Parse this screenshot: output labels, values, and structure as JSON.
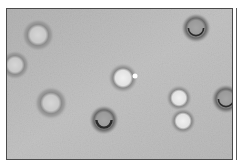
{
  "image": {
    "kind": "grayscale micrograph",
    "background_color": "#bdbdbd",
    "frame_color": "#4a4a4a",
    "cells": [
      {
        "id": 1,
        "cx": 31,
        "cy": 26,
        "r": 9,
        "style": "halo"
      },
      {
        "id": 2,
        "cx": 8,
        "cy": 56,
        "r": 8,
        "style": "halo-edge"
      },
      {
        "id": 3,
        "cx": 189,
        "cy": 19,
        "r": 8,
        "style": "dark-bottom"
      },
      {
        "id": 4,
        "cx": 116,
        "cy": 69,
        "r": 8,
        "style": "bright"
      },
      {
        "id": 5,
        "cx": 44,
        "cy": 94,
        "r": 9,
        "style": "halo"
      },
      {
        "id": 6,
        "cx": 97,
        "cy": 111,
        "r": 8,
        "style": "dark-ring"
      },
      {
        "id": 7,
        "cx": 172,
        "cy": 89,
        "r": 7,
        "style": "bright"
      },
      {
        "id": 8,
        "cx": 176,
        "cy": 112,
        "r": 7,
        "style": "bright"
      },
      {
        "id": 9,
        "cx": 219,
        "cy": 90,
        "r": 8,
        "style": "dark-edge"
      }
    ],
    "specks": [
      {
        "cx": 128,
        "cy": 67,
        "r": 2.5
      }
    ]
  }
}
